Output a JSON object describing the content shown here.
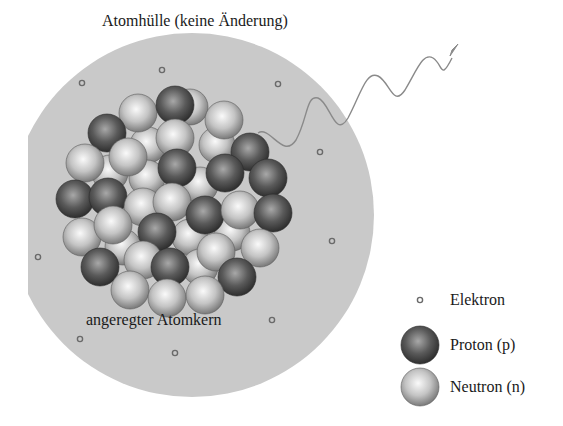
{
  "diagram": {
    "title": "",
    "shell_label": "Atomhülle (keine Änderung)",
    "nucleus_label": "angeregter Atomkern",
    "colors": {
      "shell": "#c9c9c9",
      "proton_dark": "#3c3c3c",
      "proton_light": "#9a9a9a",
      "neutron_dark": "#8a8a8a",
      "neutron_light": "#f2f2f2",
      "electron": "#6a6a6a",
      "photon_wave": "#8a8a8a"
    },
    "shell": {
      "cx": 192,
      "cy": 215,
      "r": 182
    },
    "photon": {
      "description": "gamma photon wave emitted toward upper right",
      "icon": "wavy-arrow-icon"
    },
    "electrons": [
      {
        "x": 82,
        "y": 83
      },
      {
        "x": 162,
        "y": 70
      },
      {
        "x": 278,
        "y": 84
      },
      {
        "x": 320,
        "y": 152
      },
      {
        "x": 38,
        "y": 257
      },
      {
        "x": 272,
        "y": 320
      },
      {
        "x": 80,
        "y": 339
      },
      {
        "x": 175,
        "y": 353
      },
      {
        "x": 332,
        "y": 241
      }
    ],
    "nucleons_back": [
      {
        "type": "n",
        "x": 190,
        "y": 107
      },
      {
        "type": "n",
        "x": 148,
        "y": 145
      },
      {
        "type": "n",
        "x": 217,
        "y": 145
      },
      {
        "type": "n",
        "x": 110,
        "y": 173
      },
      {
        "type": "n",
        "x": 147,
        "y": 178
      },
      {
        "type": "n",
        "x": 200,
        "y": 185
      },
      {
        "type": "n",
        "x": 190,
        "y": 237
      },
      {
        "type": "n",
        "x": 232,
        "y": 233
      },
      {
        "type": "n",
        "x": 123,
        "y": 247
      },
      {
        "type": "n",
        "x": 200,
        "y": 267
      }
    ],
    "nucleons_front": [
      {
        "type": "n",
        "x": 138,
        "y": 113
      },
      {
        "type": "p",
        "x": 175,
        "y": 105
      },
      {
        "type": "n",
        "x": 224,
        "y": 120
      },
      {
        "type": "p",
        "x": 107,
        "y": 133
      },
      {
        "type": "n",
        "x": 175,
        "y": 138
      },
      {
        "type": "p",
        "x": 250,
        "y": 152
      },
      {
        "type": "n",
        "x": 85,
        "y": 163
      },
      {
        "type": "n",
        "x": 128,
        "y": 157
      },
      {
        "type": "p",
        "x": 177,
        "y": 168
      },
      {
        "type": "p",
        "x": 225,
        "y": 173
      },
      {
        "type": "p",
        "x": 268,
        "y": 178
      },
      {
        "type": "p",
        "x": 75,
        "y": 199
      },
      {
        "type": "p",
        "x": 108,
        "y": 197
      },
      {
        "type": "n",
        "x": 143,
        "y": 207
      },
      {
        "type": "n",
        "x": 172,
        "y": 202
      },
      {
        "type": "p",
        "x": 205,
        "y": 215
      },
      {
        "type": "n",
        "x": 240,
        "y": 210
      },
      {
        "type": "p",
        "x": 273,
        "y": 213
      },
      {
        "type": "n",
        "x": 82,
        "y": 237
      },
      {
        "type": "n",
        "x": 113,
        "y": 225
      },
      {
        "type": "p",
        "x": 157,
        "y": 232
      },
      {
        "type": "n",
        "x": 260,
        "y": 248
      },
      {
        "type": "p",
        "x": 100,
        "y": 267
      },
      {
        "type": "n",
        "x": 143,
        "y": 260
      },
      {
        "type": "p",
        "x": 170,
        "y": 267
      },
      {
        "type": "n",
        "x": 216,
        "y": 252
      },
      {
        "type": "p",
        "x": 237,
        "y": 277
      },
      {
        "type": "n",
        "x": 130,
        "y": 290
      },
      {
        "type": "n",
        "x": 167,
        "y": 298
      },
      {
        "type": "n",
        "x": 205,
        "y": 295
      }
    ]
  },
  "legend": {
    "items": [
      {
        "key": "electron",
        "label": "Elektron",
        "icon": "electron-icon"
      },
      {
        "key": "proton",
        "label": "Proton (p)",
        "icon": "proton-icon"
      },
      {
        "key": "neutron",
        "label": "Neutron (n)",
        "icon": "neutron-icon"
      }
    ]
  }
}
